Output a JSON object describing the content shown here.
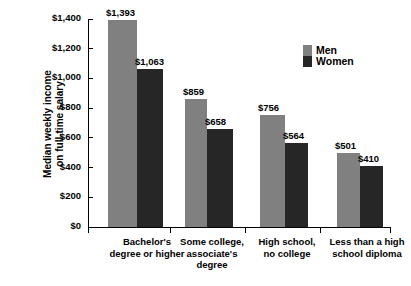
{
  "chart_data": {
    "type": "bar",
    "title": "",
    "xlabel": "",
    "ylabel": "Median weekly income\non full-time salary",
    "ylim": [
      0,
      1400
    ],
    "ytick_values": [
      0,
      200,
      400,
      600,
      800,
      1000,
      1200,
      1400
    ],
    "ytick_labels": [
      "$0",
      "$200",
      "$400",
      "$600",
      "$800",
      "$1,000",
      "$1,200",
      "$1,400"
    ],
    "grid": false,
    "legend_position": "upper-right-inside",
    "categories": [
      "Bachelor's\ndegree or higher",
      "Some college,\nassociate's\ndegree",
      "High school,\nno college",
      "Less than a high\nschool diploma"
    ],
    "series": [
      {
        "name": "Men",
        "color": "#808080",
        "values": [
          1393,
          859,
          756,
          501
        ],
        "value_labels": [
          "$1,393",
          "$859",
          "$756",
          "$501"
        ]
      },
      {
        "name": "Women",
        "color": "#262626",
        "values": [
          1063,
          658,
          564,
          410
        ],
        "value_labels": [
          "$1,063",
          "$658",
          "$564",
          "$410"
        ]
      }
    ]
  },
  "legend": {
    "items": [
      {
        "label": "Men"
      },
      {
        "label": "Women"
      }
    ]
  }
}
